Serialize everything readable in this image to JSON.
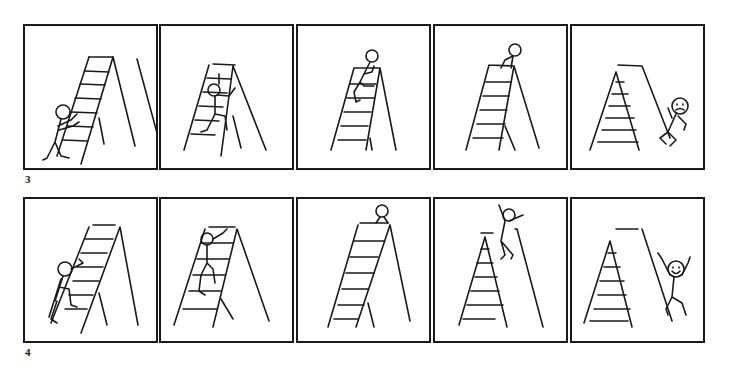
{
  "figure": {
    "rows": [
      {
        "label": "3",
        "panels": [
          {
            "scene": "stick figure approaches ladder and reaches for rungs"
          },
          {
            "scene": "stick figure climbing ladder"
          },
          {
            "scene": "stick figure near top of ladder"
          },
          {
            "scene": "stick figure sitting at top of ladder"
          },
          {
            "scene": "stick figure fallen beside ladder, sad face"
          }
        ]
      },
      {
        "label": "4",
        "panels": [
          {
            "scene": "stick figure starts climbing ladder"
          },
          {
            "scene": "stick figure climbing ladder"
          },
          {
            "scene": "stick figure at top of ladder"
          },
          {
            "scene": "stick figure jumps off ladder"
          },
          {
            "scene": "stick figure landed beside ladder, happy with arms raised"
          }
        ]
      }
    ]
  },
  "colors": {
    "ink": "#1a1a1a",
    "paper": "#ffffff"
  }
}
